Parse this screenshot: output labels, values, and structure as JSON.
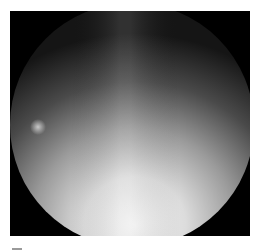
{
  "image": {
    "description": "Grayscale circular endoscopic/optical field view, bright at the bottom center fading to dark at top and edges",
    "colors": {
      "background": "#ffffff",
      "frame": "#000000",
      "field_bright": "#e8e8e8",
      "field_mid": "#8a8a8a",
      "field_dark": "#2a2a2a",
      "spot": "#bdbdbd"
    }
  }
}
